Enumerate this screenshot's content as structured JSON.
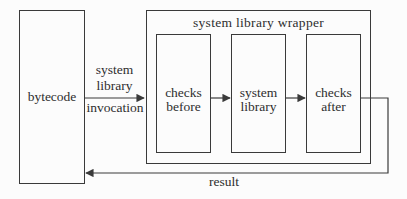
{
  "diagram": {
    "bytecode_label": "bytecode",
    "wrapper_title": "system library wrapper",
    "inner_boxes": [
      {
        "line1": "checks",
        "line2": "before"
      },
      {
        "line1": "system",
        "line2": "library"
      },
      {
        "line1": "checks",
        "line2": "after"
      }
    ],
    "invocation_label": {
      "line1": "system",
      "line2": "library",
      "line3": "invocation"
    },
    "result_label": "result",
    "colors": {
      "line": "#3a3a3a",
      "text": "#2e2e2e",
      "background": "#fcfcfc"
    }
  }
}
